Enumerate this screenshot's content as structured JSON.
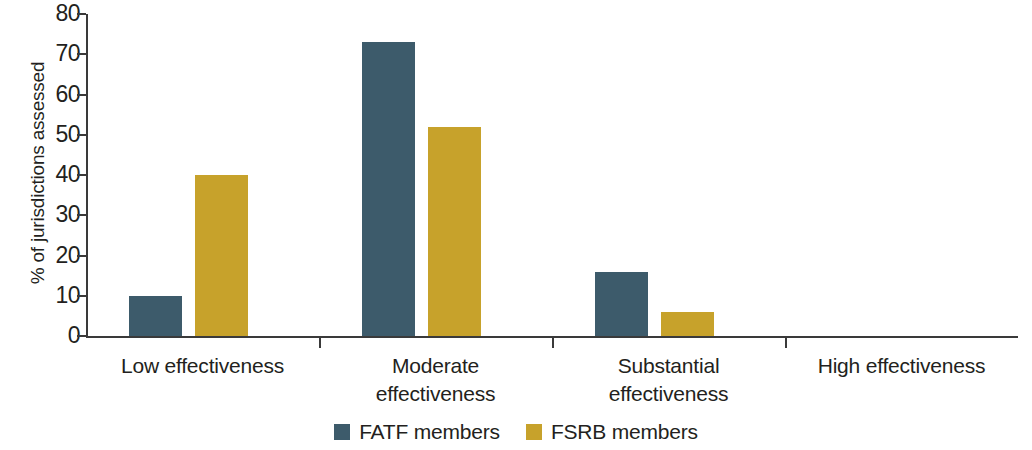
{
  "chart_data": {
    "type": "bar",
    "title": "",
    "xlabel": "",
    "ylabel": "% of jurisdictions assessed",
    "ylim": [
      0,
      80
    ],
    "ytick_values": [
      0,
      10,
      20,
      30,
      40,
      50,
      60,
      70,
      80
    ],
    "ytick_labels": [
      "0",
      "10",
      "20",
      "30",
      "40",
      "50",
      "60",
      "70",
      "80"
    ],
    "grid": false,
    "legend_position": "bottom-center",
    "categories": [
      "Low effectiveness",
      "Moderate effectiveness",
      "Substantial effectiveness",
      "High effectiveness"
    ],
    "category_lines": [
      [
        "Low effectiveness"
      ],
      [
        "Moderate",
        "effectiveness"
      ],
      [
        "Substantial",
        "effectiveness"
      ],
      [
        "High effectiveness"
      ]
    ],
    "series": [
      {
        "name": "FATF members",
        "color": "#3d5b6b",
        "values": [
          10,
          73,
          16,
          0
        ]
      },
      {
        "name": "FSRB members",
        "color": "#c7a22b",
        "values": [
          40,
          52,
          6,
          0
        ]
      }
    ]
  },
  "legend": {
    "items": [
      {
        "label": "FATF members",
        "key": "fatf"
      },
      {
        "label": "FSRB members",
        "key": "fsrb"
      }
    ]
  }
}
